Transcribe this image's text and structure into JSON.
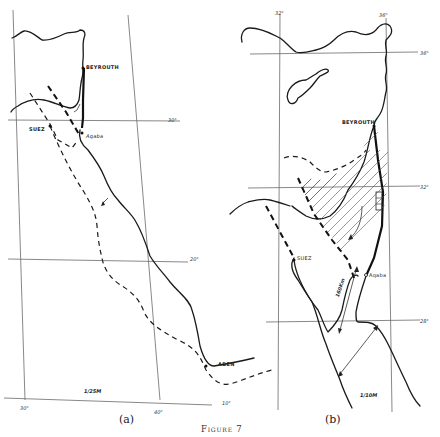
{
  "figure": {
    "caption": "Figure 7",
    "panels": [
      {
        "id": "a",
        "label": "(a)",
        "scale": "1/25M",
        "places": [
          "BEYROUTH",
          "SUEZ",
          "Aqaba",
          "ADEN"
        ],
        "grid_labels": {
          "lat_30": "30°",
          "lat_20": "20°",
          "lat_10": "10°",
          "lon_30": "30°",
          "lon_40": "40°"
        }
      },
      {
        "id": "b",
        "label": "(b)",
        "scale": "1/10M",
        "places": [
          "BEYROUTH",
          "SUEZ",
          "Aqaba"
        ],
        "distance_label": "160Km",
        "grid_labels": {
          "lon_32": "32°",
          "lon_36": "36°",
          "lat_36": "36°",
          "lat_32": "32°",
          "lat_28": "28°"
        }
      }
    ]
  }
}
